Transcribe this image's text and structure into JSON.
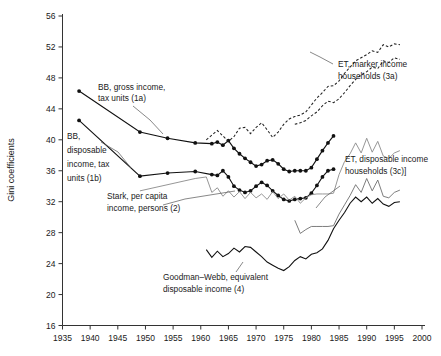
{
  "chart_data": {
    "type": "line",
    "title": "",
    "xlabel": "",
    "ylabel": "Gini coefficients",
    "xlim": [
      1935,
      2000
    ],
    "ylim": [
      16,
      56
    ],
    "xticks": [
      1935,
      1940,
      1945,
      1950,
      1955,
      1960,
      1965,
      1970,
      1975,
      1980,
      1985,
      1990,
      1995,
      2000
    ],
    "yticks": [
      16,
      20,
      24,
      28,
      32,
      36,
      40,
      44,
      48,
      52,
      56
    ],
    "grid": false,
    "legend_position": "inline-annotations",
    "series": [
      {
        "name": "BB, gross income, tax units (1a)",
        "style": "solid-markers",
        "markers": true,
        "x": [
          1938,
          1949,
          1954,
          1959,
          1962,
          1963,
          1964,
          1965,
          1966,
          1967,
          1968,
          1969,
          1970,
          1971,
          1972,
          1973,
          1974,
          1975,
          1976,
          1977,
          1978,
          1979,
          1980,
          1981,
          1982,
          1983,
          1984
        ],
        "y": [
          46.3,
          41.0,
          40.2,
          39.6,
          39.5,
          39.7,
          39.3,
          39.9,
          38.9,
          38.2,
          37.6,
          37.1,
          36.6,
          36.8,
          37.3,
          37.4,
          36.9,
          36.2,
          35.9,
          36.0,
          36.0,
          36.0,
          36.4,
          37.5,
          38.6,
          39.6,
          40.5
        ]
      },
      {
        "name": "BB, disposable income, tax units (1b)",
        "style": "solid-markers",
        "markers": true,
        "x": [
          1938,
          1949,
          1954,
          1959,
          1962,
          1963,
          1964,
          1965,
          1966,
          1967,
          1968,
          1969,
          1970,
          1971,
          1972,
          1973,
          1974,
          1975,
          1976,
          1977,
          1978,
          1979,
          1980,
          1981,
          1982,
          1983,
          1984
        ],
        "y": [
          42.5,
          35.3,
          35.7,
          35.9,
          35.5,
          35.4,
          36.0,
          35.2,
          34.0,
          33.5,
          33.2,
          33.4,
          34.0,
          34.5,
          34.1,
          33.4,
          32.8,
          32.3,
          32.1,
          32.3,
          32.4,
          32.5,
          33.1,
          34.1,
          35.2,
          36.0,
          36.2
        ]
      },
      {
        "name": "Stark, per capita income, persons (2)",
        "style": "thin-line",
        "markers": false,
        "x": [
          1949,
          1959,
          1961,
          1962,
          1963,
          1964,
          1965,
          1966,
          1967,
          1968,
          1969,
          1970,
          1971,
          1972,
          1973,
          1974,
          1975,
          1976,
          1977,
          1978,
          1979,
          1980,
          1981,
          1982,
          1983,
          1984,
          1985,
          1986,
          1987,
          1988,
          1989,
          1990,
          1991,
          1992,
          1993,
          1994,
          1995,
          1996
        ],
        "y": [
          33.4,
          35.0,
          35.2,
          33.2,
          33.8,
          32.7,
          33.4,
          32.6,
          33.3,
          32.4,
          33.2,
          32.5,
          33.0,
          32.3,
          33.3,
          32.4,
          33.0,
          32.2,
          32.7,
          31.8,
          32.5,
          32.9,
          33.0,
          33.0,
          33.0,
          33.1,
          35.5,
          37.2,
          38.2,
          39.6,
          38.3,
          40.2,
          38.4,
          39.8,
          37.9,
          37.6,
          38.3,
          38.6
        ]
      },
      {
        "name": "ET, marker income households (3a) upper",
        "style": "dashed",
        "markers": false,
        "x": [
          1961,
          1962,
          1963,
          1964,
          1965,
          1966,
          1967,
          1968,
          1969,
          1970,
          1971,
          1972,
          1973,
          1974,
          1975,
          1976,
          1977,
          1978,
          1979,
          1980,
          1981,
          1982,
          1983,
          1984,
          1985,
          1986,
          1987,
          1988,
          1989,
          1990,
          1991,
          1992,
          1993,
          1994,
          1995,
          1996
        ],
        "y": [
          40.0,
          40.6,
          41.2,
          40.5,
          39.8,
          40.4,
          41.5,
          41.6,
          40.8,
          41.6,
          42.2,
          41.3,
          40.3,
          41.0,
          42.0,
          42.7,
          43.0,
          43.2,
          43.6,
          44.5,
          45.4,
          46.1,
          46.9,
          47.0,
          47.6,
          48.6,
          49.4,
          50.2,
          50.6,
          51.0,
          51.5,
          51.3,
          52.3,
          52.0,
          52.4,
          52.3
        ]
      },
      {
        "name": "ET, marker income households (3a) lower",
        "style": "dashed",
        "markers": false,
        "x": [
          1977,
          1978,
          1979,
          1980,
          1981,
          1982,
          1983,
          1984,
          1985,
          1986,
          1987,
          1988,
          1989,
          1990,
          1991,
          1992,
          1993,
          1994,
          1995,
          1996
        ],
        "y": [
          42.0,
          42.2,
          42.5,
          43.1,
          43.6,
          44.4,
          45.0,
          44.8,
          45.3,
          46.1,
          47.0,
          47.8,
          48.4,
          48.8,
          49.4,
          49.2,
          50.2,
          50.0,
          50.6,
          50.4
        ]
      },
      {
        "name": "ET, disposable income households (3c)",
        "style": "thin-line-2",
        "markers": false,
        "x": [
          1977,
          1978,
          1979,
          1980,
          1981,
          1982,
          1983,
          1984,
          1985,
          1986,
          1987,
          1988,
          1989,
          1990,
          1991,
          1992,
          1993,
          1994,
          1995,
          1996
        ],
        "y": [
          29.6,
          27.9,
          28.4,
          28.8,
          28.8,
          28.8,
          28.8,
          28.9,
          30.4,
          31.6,
          32.8,
          34.2,
          33.2,
          35.0,
          33.4,
          34.8,
          32.7,
          32.5,
          33.2,
          33.5
        ]
      },
      {
        "name": "Goodman-Webb, equivalent disposable income (4)",
        "style": "solid-line",
        "markers": false,
        "x": [
          1961,
          1962,
          1963,
          1964,
          1965,
          1966,
          1967,
          1968,
          1969,
          1970,
          1971,
          1972,
          1973,
          1974,
          1975,
          1976,
          1977,
          1978,
          1979,
          1980,
          1981,
          1982,
          1983,
          1984,
          1985,
          1986,
          1987,
          1988,
          1989,
          1990,
          1991,
          1992,
          1993,
          1994,
          1995,
          1996
        ],
        "y": [
          25.8,
          24.8,
          25.6,
          24.9,
          25.3,
          26.0,
          25.5,
          26.2,
          26.1,
          25.5,
          24.9,
          24.2,
          23.8,
          23.4,
          23.1,
          23.6,
          24.4,
          24.9,
          24.6,
          25.2,
          25.4,
          25.9,
          27.0,
          28.5,
          29.6,
          30.6,
          31.8,
          32.6,
          32.0,
          32.6,
          31.8,
          32.4,
          31.7,
          31.4,
          31.9,
          32.0
        ]
      }
    ],
    "annotations": [
      {
        "id": "ann-1a",
        "text_line1": "BB, gross income,",
        "text_line2": "tax units (1a)"
      },
      {
        "id": "ann-1b",
        "text_line1": "BB,",
        "text_line2": "disposable",
        "text_line3": "income, tax",
        "text_line4": "units (1b)"
      },
      {
        "id": "ann-2",
        "text_line1": "Stark, per capita",
        "text_line2": "income, persons (2)"
      },
      {
        "id": "ann-3a",
        "text_line1": "ET, marker income",
        "text_line2": "households (3a)"
      },
      {
        "id": "ann-3c",
        "text_line1": "ET, disposable income",
        "text_line2": "households (3c)]"
      },
      {
        "id": "ann-4",
        "text_line1": "Goodman–Webb, equivalent",
        "text_line2": "disposable income (4)"
      }
    ]
  },
  "colors": {
    "axis": "#333333",
    "solid_series": "#111111",
    "dashed_series": "#222222",
    "thin_series": "#8a8a8a",
    "background": "#ffffff",
    "text": "#1a1a1a"
  }
}
